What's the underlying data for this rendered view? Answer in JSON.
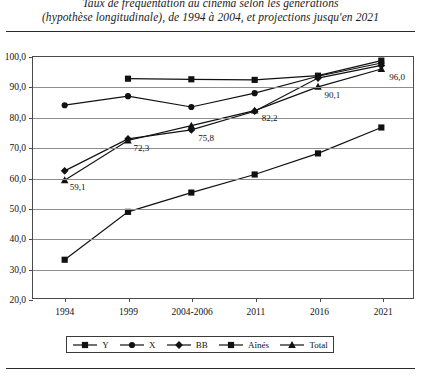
{
  "title": {
    "line1": "Taux de fréquentation au cinéma selon les générations",
    "line2": "(hypothèse longitudinale), de 1994 à 2004, et projections jusqu'en 2021"
  },
  "legend": {
    "items": [
      {
        "label": "Y",
        "marker": "square-marker-icon"
      },
      {
        "label": "X",
        "marker": "circle-marker-icon"
      },
      {
        "label": "BB",
        "marker": "diamond-marker-icon"
      },
      {
        "label": "Aînés",
        "marker": "square-marker-icon"
      },
      {
        "label": "Total",
        "marker": "triangle-marker-icon"
      }
    ]
  },
  "axis": {
    "y_ticks": [
      "100,0",
      "90,0",
      "80,0",
      "70,0",
      "60,0",
      "50,0",
      "40,0",
      "30,0",
      "20,0"
    ],
    "x_ticks": [
      "1994",
      "1999",
      "2004-2006",
      "2011",
      "2016",
      "2021"
    ]
  },
  "colors": {
    "line": "#111111",
    "grid": "#8e8e8e",
    "frame": "#4a4a4a",
    "text": "#111111"
  },
  "chart_data": {
    "type": "line",
    "title": "Taux de fréquentation au cinéma selon les générations (hypothèse longitudinale), de 1994 à 2004, et projections jusqu'en 2021",
    "xlabel": "",
    "ylabel": "",
    "categories": [
      "1994",
      "1999",
      "2004-2006",
      "2011",
      "2016",
      "2021"
    ],
    "ylim": [
      20.0,
      100.0
    ],
    "ytick_step": 10.0,
    "grid": true,
    "legend_position": "bottom",
    "decimal_separator": ",",
    "series": [
      {
        "name": "Y",
        "marker": "square",
        "values": [
          null,
          92.8,
          92.6,
          92.4,
          93.8,
          98.8
        ]
      },
      {
        "name": "X",
        "marker": "circle",
        "values": [
          84.0,
          87.0,
          83.4,
          88.0,
          93.6,
          98.0
        ]
      },
      {
        "name": "BB",
        "marker": "diamond",
        "values": [
          62.2,
          72.8,
          75.8,
          82.0,
          93.0,
          97.2
        ]
      },
      {
        "name": "Aînés",
        "marker": "square",
        "values": [
          32.7,
          48.6,
          55.0,
          61.0,
          68.0,
          76.6
        ]
      },
      {
        "name": "Total",
        "marker": "triangle",
        "values": [
          59.1,
          72.3,
          77.2,
          82.2,
          90.1,
          96.0
        ]
      }
    ],
    "data_labels": [
      {
        "series": "Total",
        "category": "1994",
        "text": "59,1"
      },
      {
        "series": "Total",
        "category": "1999",
        "text": "72,3"
      },
      {
        "series": "BB",
        "category": "2004-2006",
        "text": "75,8"
      },
      {
        "series": "Total",
        "category": "2011",
        "text": "82,2"
      },
      {
        "series": "Total",
        "category": "2016",
        "text": "90,1"
      },
      {
        "series": "Total",
        "category": "2021",
        "text": "96,0"
      }
    ]
  }
}
